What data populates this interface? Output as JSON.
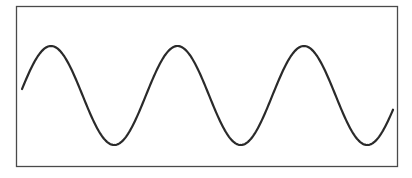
{
  "diagram": {
    "type": "sine-wave",
    "cycles": 3,
    "frame": {
      "x": 16,
      "y": 6,
      "width": 381,
      "height": 160,
      "stroke": "#4a4a4a"
    },
    "wave": {
      "stroke": "#2a2a2a",
      "start": [
        22,
        85
      ],
      "peaks_x": [
        51,
        178,
        304
      ],
      "troughs_x": [
        113,
        242,
        368
      ],
      "peak_y": 46,
      "trough_y": 145,
      "end": [
        393,
        115
      ]
    }
  }
}
